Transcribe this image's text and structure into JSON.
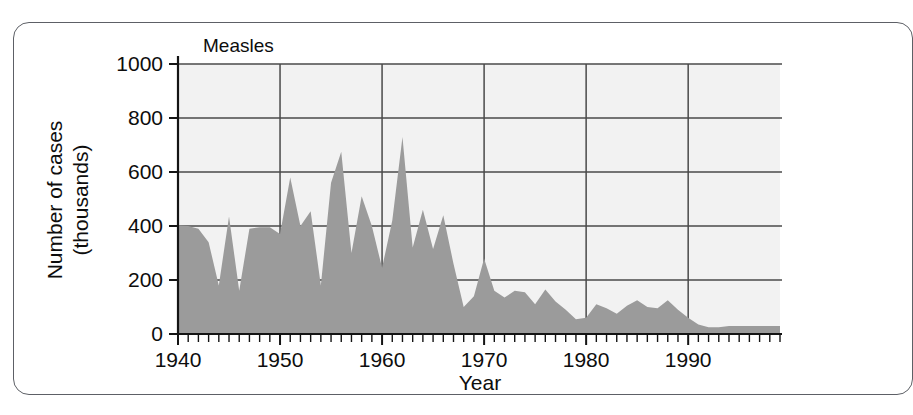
{
  "figure": {
    "series_title": "Measles"
  },
  "chart_data": {
    "type": "area",
    "title": "Measles",
    "xlabel": "Year",
    "ylabel": "Number of cases (thousands)",
    "ylabel_lines": [
      "Number of cases",
      "(thousands)"
    ],
    "xlim": [
      1940,
      1999
    ],
    "ylim": [
      0,
      1000
    ],
    "ytick_labels": [
      "0",
      "200",
      "400",
      "600",
      "800",
      "1000"
    ],
    "ytick_values": [
      0,
      200,
      400,
      600,
      800,
      1000
    ],
    "xtick_labels": [
      "1940",
      "1950",
      "1960",
      "1970",
      "1980",
      "1990"
    ],
    "xtick_values": [
      1940,
      1950,
      1960,
      1970,
      1980,
      1990
    ],
    "minor_xtick_interval": 1,
    "grid": true,
    "legend": "none",
    "area_color": "#9b9b9b",
    "plot_background": "#f2f2f2",
    "grid_color": "#4a4a4a",
    "axis_color": "#1a1a1a",
    "series": [
      {
        "name": "Measles",
        "units": "thousands of cases",
        "x": [
          1940,
          1941,
          1942,
          1943,
          1944,
          1945,
          1946,
          1947,
          1948,
          1949,
          1950,
          1951,
          1952,
          1953,
          1954,
          1955,
          1956,
          1957,
          1958,
          1959,
          1960,
          1961,
          1962,
          1963,
          1964,
          1965,
          1966,
          1967,
          1968,
          1969,
          1970,
          1971,
          1972,
          1973,
          1974,
          1975,
          1976,
          1977,
          1978,
          1979,
          1980,
          1981,
          1982,
          1983,
          1984,
          1985,
          1986,
          1987,
          1988,
          1989,
          1990,
          1991,
          1992,
          1993,
          1994,
          1995,
          1996,
          1997,
          1998,
          1999
        ],
        "values": [
          402,
          400,
          390,
          340,
          180,
          435,
          160,
          390,
          395,
          395,
          370,
          580,
          400,
          455,
          180,
          560,
          675,
          300,
          510,
          400,
          245,
          420,
          730,
          320,
          460,
          315,
          440,
          260,
          100,
          140,
          280,
          160,
          135,
          160,
          155,
          110,
          165,
          120,
          90,
          55,
          60,
          110,
          95,
          75,
          105,
          125,
          100,
          95,
          125,
          90,
          60,
          35,
          25,
          25,
          30,
          30,
          30,
          30,
          30,
          30
        ]
      }
    ]
  }
}
